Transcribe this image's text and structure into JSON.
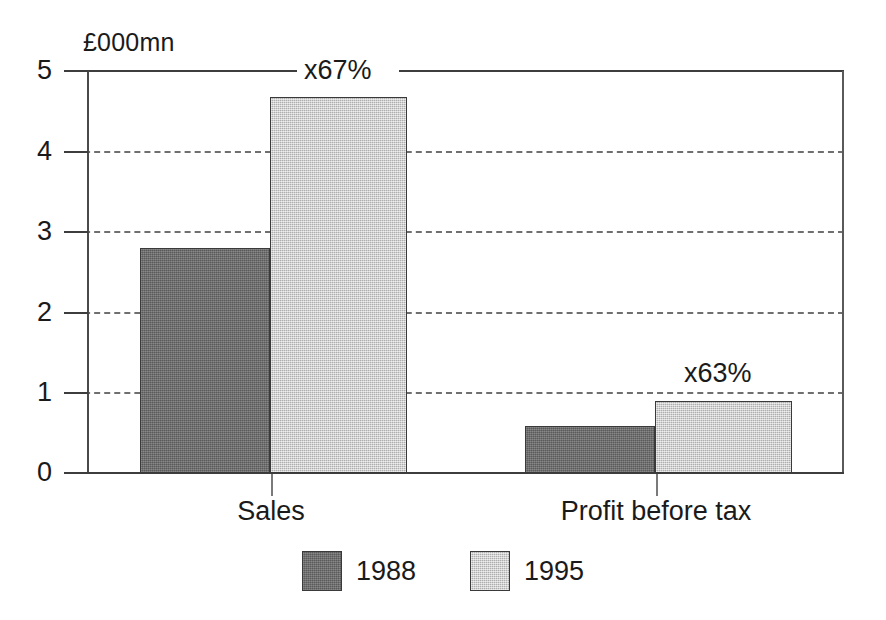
{
  "chart_data": {
    "type": "bar",
    "title": "",
    "subtitle": "",
    "xlabel": "",
    "ylabel": "£000mn",
    "ylim": [
      0,
      5
    ],
    "yticks": [
      "0",
      "1",
      "2",
      "3",
      "4",
      "5"
    ],
    "grid": "horizontal-dashed",
    "legend_position": "bottom-center",
    "categories": [
      "Sales",
      "Profit before tax"
    ],
    "series": [
      {
        "name": "1988",
        "values": [
          2.8,
          0.59
        ],
        "color": "#6e6e6e"
      },
      {
        "name": "1995",
        "values": [
          4.68,
          0.9
        ],
        "color": "#c9c9c9"
      }
    ],
    "annotations": [
      {
        "text": "x67%",
        "category": "Sales",
        "at_value": 5
      },
      {
        "text": "x63%",
        "category": "Profit before tax",
        "at_value": 1
      }
    ]
  },
  "axis": {
    "y_title": "£000mn",
    "ticks": [
      {
        "label": "5",
        "value": 5,
        "style": "solid"
      },
      {
        "label": "4",
        "value": 4,
        "style": "dashed"
      },
      {
        "label": "3",
        "value": 3,
        "style": "dashed"
      },
      {
        "label": "2",
        "value": 2,
        "style": "dashed"
      },
      {
        "label": "1",
        "value": 1,
        "style": "dashed"
      },
      {
        "label": "0",
        "value": 0,
        "style": "solid"
      }
    ]
  },
  "categories": [
    {
      "label": "Sales"
    },
    {
      "label": "Profit before tax"
    }
  ],
  "annotations": [
    {
      "label": "x67%"
    },
    {
      "label": "x63%"
    }
  ],
  "legend": {
    "items": [
      {
        "label": "1988",
        "color": "#6e6e6e"
      },
      {
        "label": "1995",
        "color": "#c9c9c9"
      }
    ]
  }
}
